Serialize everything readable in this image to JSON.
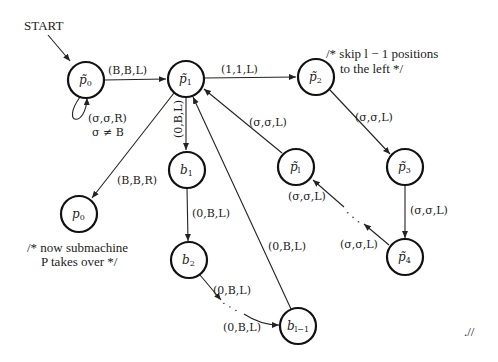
{
  "start_label": "START",
  "nodes": {
    "pt0": {
      "base": "p̃",
      "sub": "0"
    },
    "pt1": {
      "base": "p̃",
      "sub": "1"
    },
    "pt2": {
      "base": "p̃",
      "sub": "2"
    },
    "pt3": {
      "base": "p̃",
      "sub": "3"
    },
    "pt4": {
      "base": "p̃",
      "sub": "4"
    },
    "ptl": {
      "base": "p̃",
      "sub": "l"
    },
    "b1": {
      "base": "b",
      "sub": "1"
    },
    "b2": {
      "base": "b",
      "sub": "2"
    },
    "bl1": {
      "base": "b",
      "sub": "l−1"
    },
    "p0": {
      "base": "p",
      "sub": "0"
    }
  },
  "edges": {
    "pt0_pt1": "(B,B,L)",
    "pt0_loop": "(σ,σ,R)",
    "pt0_loop_cond": "σ ≠ B",
    "pt1_pt2": "(1,1,L)",
    "pt1_b1": "(0,B,L)",
    "pt1_p0": "(B,B,R)",
    "ptl_pt1": "(σ,σ,L)",
    "pt2_pt3": "(σ,σ,L)",
    "pt3_pt4": "(σ,σ,L)",
    "pt4_dots": "(σ,σ,L)",
    "dots_ptl": "(σ,σ,L)",
    "b1_b2": "(0,B,L)",
    "b2_dots": "(0,B,L)",
    "dots_bl1": "(0,B,L)",
    "bl1_pt1": "(0,B,L)"
  },
  "ellipsis": ". . .",
  "comments": {
    "skip_line1": "/* skip l − 1 positions",
    "skip_line2": "to the left */",
    "sub_line1": "/* now submachine",
    "sub_line2": "P takes over */"
  },
  "end_mark": ".//"
}
